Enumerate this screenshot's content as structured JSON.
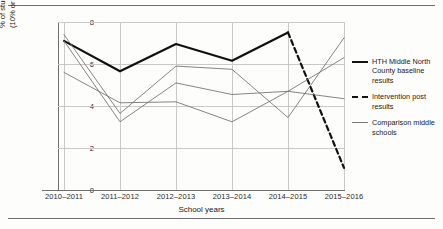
{
  "figure": {
    "rules": [
      "top-rule",
      "bottom-rule"
    ]
  },
  "axes": {
    "ylabel_line1": "% of students chronically absent",
    "ylabel_line2": "(10% or more days)",
    "xlabel": "School years",
    "yticks": [
      "8",
      "6",
      "4",
      "2",
      "0"
    ],
    "xticks": [
      "2010–2011",
      "2011–2012",
      "2012–2013",
      "2013–2014",
      "2014–2015",
      "2015–2016"
    ]
  },
  "legend": {
    "position": "right",
    "items": [
      {
        "swatch": "solid-bold-line",
        "label": "HTH Middle North County baseline results"
      },
      {
        "swatch": "dashed-bold-line",
        "label": "Intervention post results"
      },
      {
        "swatch": "thin-line",
        "label": "Comparison middle schools"
      }
    ]
  },
  "colors": {
    "baseline": "#111111",
    "intervention": "#111111",
    "comparison": "#6f6f6f",
    "grid": "#c9c9c9",
    "axis": "#6f6f6f",
    "background": "#fdfdfb"
  },
  "chart_data": {
    "type": "line",
    "title": "",
    "xlabel": "School years",
    "ylabel": "% of students chronically absent (10% or more days)",
    "ylim": [
      0,
      8
    ],
    "yticks": [
      0,
      2,
      4,
      6,
      8
    ],
    "grid": true,
    "legend_position": "right",
    "categories": [
      "2010–2011",
      "2011–2012",
      "2012–2013",
      "2013–2014",
      "2014–2015",
      "2015–2016"
    ],
    "series": [
      {
        "name": "HTH Middle North County baseline results",
        "style": "solid-bold",
        "color": "#111111",
        "values": [
          7.1,
          5.65,
          6.95,
          6.15,
          7.5,
          null
        ]
      },
      {
        "name": "Intervention post results",
        "style": "dashed-bold",
        "color": "#111111",
        "values": [
          null,
          null,
          null,
          null,
          7.5,
          1.05
        ]
      },
      {
        "name": "Comparison middle schools 1",
        "style": "thin",
        "color": "#6f6f6f",
        "values": [
          7.4,
          3.65,
          5.9,
          5.75,
          3.45,
          7.25
        ]
      },
      {
        "name": "Comparison middle schools 2",
        "style": "thin",
        "color": "#6f6f6f",
        "values": [
          7.1,
          3.25,
          5.1,
          4.55,
          4.7,
          4.35
        ]
      },
      {
        "name": "Comparison middle schools 3",
        "style": "thin",
        "color": "#6f6f6f",
        "values": [
          5.6,
          4.15,
          4.2,
          3.25,
          4.7,
          6.3
        ]
      }
    ]
  }
}
